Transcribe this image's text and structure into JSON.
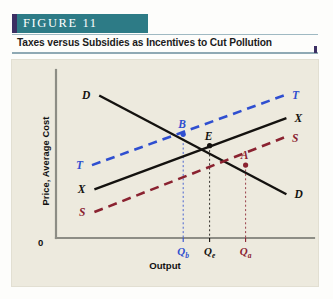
{
  "header": {
    "figure_label": "FIGURE 11",
    "band_color": "#2d7b86",
    "accent_color": "#3c2f63",
    "subtitle": "Taxes versus Subsidies as Incentives to Cut Pollution"
  },
  "chart_data": {
    "type": "line",
    "title": "Taxes versus Subsidies as Incentives to Cut Pollution",
    "xlabel": "Output",
    "ylabel": "Price, Average Cost",
    "origin_label": "0",
    "grid": false,
    "legend": "inline-endpoint-labels",
    "xlim": [
      0,
      100
    ],
    "ylim": [
      0,
      100
    ],
    "axis_color": "#8d8d85",
    "series": [
      {
        "name": "D",
        "label": "D",
        "role": "demand",
        "color": "#14120f",
        "style": "solid",
        "left_label": "D",
        "right_label": "D",
        "x": [
          18,
          96
        ],
        "y": [
          88,
          27
        ]
      },
      {
        "name": "X",
        "label": "X",
        "role": "private-marginal-cost",
        "color": "#14120f",
        "style": "solid",
        "left_label": "X",
        "right_label": "X",
        "x": [
          16,
          96
        ],
        "y": [
          30,
          74
        ]
      },
      {
        "name": "T",
        "label": "T",
        "role": "tax",
        "color": "#2f4fd0",
        "style": "dashed",
        "left_label": "T",
        "right_label": "T",
        "x": [
          15,
          95
        ],
        "y": [
          45,
          88
        ]
      },
      {
        "name": "S",
        "label": "S",
        "role": "subsidy",
        "color": "#8a2230",
        "style": "dashed",
        "left_label": "S",
        "right_label": "S",
        "x": [
          16,
          95
        ],
        "y": [
          16,
          62
        ]
      }
    ],
    "points": [
      {
        "label": "B",
        "x": 53,
        "y": 64,
        "color": "#2f4fd0",
        "tick_label": "Qb",
        "tick_sub": "b"
      },
      {
        "label": "E",
        "x": 64,
        "y": 57,
        "color": "#14120f",
        "tick_label": "Qe",
        "tick_sub": "e"
      },
      {
        "label": "A",
        "x": 79,
        "y": 45,
        "color": "#8a2230",
        "tick_label": "Qa",
        "tick_sub": "a"
      }
    ],
    "tick_labels": [
      {
        "text": "Q",
        "sub": "b",
        "color": "#2f4fd0"
      },
      {
        "text": "Q",
        "sub": "e",
        "color": "#14120f"
      },
      {
        "text": "Q",
        "sub": "a",
        "color": "#8a2230"
      }
    ]
  }
}
